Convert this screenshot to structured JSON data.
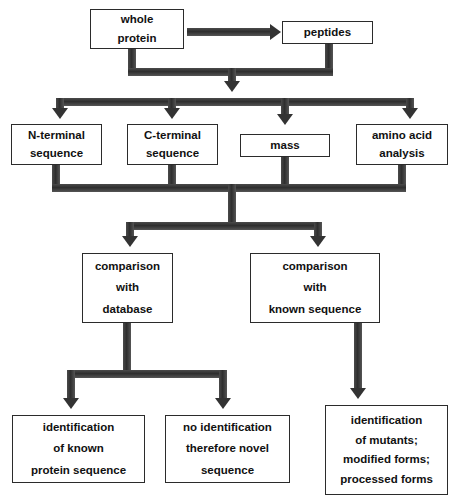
{
  "diagram": {
    "line_color": "#3a3a3a",
    "box_border_color": "#2b2b2b",
    "background": "#ffffff",
    "nodes": {
      "whole_protein": {
        "lines": [
          "whole",
          "protein"
        ]
      },
      "peptides": {
        "lines": [
          "peptides"
        ]
      },
      "n_terminal": {
        "lines": [
          "N-terminal",
          "sequence"
        ]
      },
      "c_terminal": {
        "lines": [
          "C-terminal",
          "sequence"
        ]
      },
      "mass": {
        "lines": [
          "mass"
        ]
      },
      "amino_acid": {
        "lines": [
          "amino acid",
          "analysis"
        ]
      },
      "comparison_database": {
        "lines": [
          "comparison",
          "with",
          "database"
        ]
      },
      "comparison_known": {
        "lines": [
          "comparison",
          "with",
          "known sequence"
        ]
      },
      "identification_known": {
        "lines": [
          "identification",
          "of known",
          "protein sequence"
        ]
      },
      "no_identification": {
        "lines": [
          "no identification",
          "therefore novel",
          "sequence"
        ]
      },
      "identification_mutants": {
        "lines": [
          "identification",
          "of mutants;",
          "modified forms;",
          "processed forms"
        ]
      }
    }
  }
}
